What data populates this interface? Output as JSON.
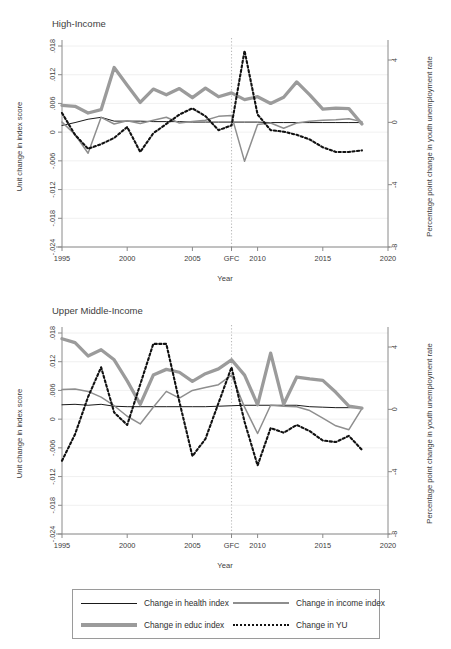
{
  "figure": {
    "background": "#ffffff",
    "xlabel": "Year",
    "ylabel_left": "Unit change in index score",
    "ylabel_right": "Percentage point change in youth unemployment rate"
  },
  "legend": {
    "items": [
      {
        "label": "Change in health index",
        "style": "thin-black-solid",
        "color": "#1a1a1a",
        "icon": "line-swatch-icon"
      },
      {
        "label": "Change in income index",
        "style": "medium-gray-solid",
        "color": "#8e8e8e",
        "icon": "line-swatch-icon"
      },
      {
        "label": "Change in educ index",
        "style": "thick-gray-solid",
        "color": "#9b9b9b",
        "icon": "line-swatch-icon"
      },
      {
        "label": "Change in YU",
        "style": "black-dotted",
        "color": "#111111",
        "icon": "dotted-line-swatch-icon"
      }
    ]
  },
  "chart_data": [
    {
      "type": "line",
      "title": "High-Income",
      "xlabel": "Year",
      "ylabel": "Unit change in index score",
      "ylabel_secondary": "Percentage point change in youth unemployment rate",
      "xlim": [
        1995,
        2020
      ],
      "xticks": [
        1995,
        2000,
        2005,
        2008,
        2010,
        2015,
        2020
      ],
      "xticklabels": [
        "1995",
        "2000",
        "2005",
        "GFC",
        "2010",
        "2015",
        "2020"
      ],
      "ylim": [
        -0.024,
        0.018
      ],
      "yticks": [
        0.018,
        0.012,
        0.006,
        0,
        -0.006,
        -0.012,
        -0.018,
        -0.024
      ],
      "yticklabels": [
        ".018",
        ".012",
        ".006",
        "0",
        "-.006",
        "-.012",
        "-.018",
        "-.024"
      ],
      "ylim_secondary": [
        -8,
        4.9
      ],
      "yticks_secondary": [
        4,
        0,
        -4,
        -8
      ],
      "yticklabels_secondary": [
        "4",
        "0",
        "-4",
        "-8"
      ],
      "grid": true,
      "annotations": [
        {
          "type": "vline",
          "x": 2008,
          "label": "GFC",
          "style": "dotted"
        }
      ],
      "x": [
        1995,
        1996,
        1997,
        1998,
        1999,
        2000,
        2001,
        2002,
        2003,
        2004,
        2005,
        2006,
        2007,
        2008,
        2009,
        2010,
        2011,
        2012,
        2013,
        2014,
        2015,
        2016,
        2017,
        2018
      ],
      "series": [
        {
          "name": "Change in health index",
          "axis": "left",
          "values": [
            0.0014,
            0.002,
            0.0027,
            0.0031,
            0.0023,
            0.0023,
            0.0023,
            0.0022,
            0.0022,
            0.0022,
            0.0021,
            0.0021,
            0.0021,
            0.0021,
            0.0021,
            0.0021,
            0.002,
            0.002,
            0.002,
            0.002,
            0.002,
            0.002,
            0.002,
            0.002
          ]
        },
        {
          "name": "Change in income index",
          "axis": "left",
          "values": [
            0.0021,
            -0.0005,
            -0.0044,
            0.0031,
            0.0017,
            0.0024,
            0.0018,
            0.0025,
            0.0031,
            0.0019,
            0.0022,
            0.0025,
            0.0033,
            0.0035,
            -0.0061,
            0.0016,
            0.0019,
            0.0008,
            0.0019,
            0.0023,
            0.0025,
            0.0026,
            0.0028,
            0.0022
          ]
        },
        {
          "name": "Change in educ index",
          "axis": "left",
          "values": [
            0.0056,
            0.0054,
            0.004,
            0.0047,
            0.0135,
            0.0098,
            0.0062,
            0.009,
            0.0078,
            0.0091,
            0.0072,
            0.0092,
            0.0074,
            0.0082,
            0.0068,
            0.0074,
            0.006,
            0.0073,
            0.0105,
            0.0078,
            0.0048,
            0.005,
            0.0049,
            0.0017
          ]
        },
        {
          "name": "Change in YU",
          "axis": "right",
          "values": [
            0.6,
            -0.8,
            -1.7,
            -1.4,
            -1.0,
            -0.3,
            -1.9,
            -0.7,
            -0.1,
            0.5,
            0.9,
            0.4,
            -0.5,
            -0.2,
            4.6,
            0.5,
            -0.5,
            -0.6,
            -0.8,
            -1.1,
            -1.6,
            -1.9,
            -1.9,
            -1.8
          ]
        }
      ]
    },
    {
      "type": "line",
      "title": "Upper Middle-Income",
      "xlabel": "Year",
      "ylabel": "Unit change in index score",
      "ylabel_secondary": "Percentage point change in youth unemployment rate",
      "xlim": [
        1995,
        2020
      ],
      "xticks": [
        1995,
        2000,
        2005,
        2008,
        2010,
        2015,
        2020
      ],
      "xticklabels": [
        "1995",
        "2000",
        "2005",
        "GFC",
        "2010",
        "2015",
        "2020"
      ],
      "ylim": [
        -0.024,
        0.018
      ],
      "yticks": [
        0.018,
        0.012,
        0.006,
        0,
        -0.006,
        -0.012,
        -0.018,
        -0.024
      ],
      "yticklabels": [
        ".018",
        ".012",
        ".006",
        "0",
        "-.006",
        "-.012",
        "-.018",
        "-.024"
      ],
      "ylim_secondary": [
        -8,
        4.9
      ],
      "yticks_secondary": [
        4,
        0,
        -4,
        -8
      ],
      "yticklabels_secondary": [
        "4",
        "0",
        "-4",
        "-8"
      ],
      "grid": true,
      "annotations": [
        {
          "type": "vline",
          "x": 2008,
          "label": "GFC",
          "style": "dotted"
        }
      ],
      "x": [
        1995,
        1996,
        1997,
        1998,
        1999,
        2000,
        2001,
        2002,
        2003,
        2004,
        2005,
        2006,
        2007,
        2008,
        2009,
        2010,
        2011,
        2012,
        2013,
        2014,
        2015,
        2016,
        2017,
        2018
      ],
      "series": [
        {
          "name": "Change in health index",
          "axis": "left",
          "values": [
            0.003,
            0.0031,
            0.0029,
            0.0031,
            0.0027,
            0.0026,
            0.0026,
            0.0026,
            0.0026,
            0.0026,
            0.0026,
            0.0026,
            0.0027,
            0.0028,
            0.0029,
            0.0029,
            0.0029,
            0.0029,
            0.0029,
            0.0026,
            0.0025,
            0.0024,
            0.0024,
            0.0024
          ]
        },
        {
          "name": "Change in income index",
          "axis": "left",
          "values": [
            0.0062,
            0.0063,
            0.0058,
            0.0046,
            0.0028,
            0.0006,
            -0.001,
            0.0025,
            0.0058,
            0.0044,
            0.006,
            0.0066,
            0.0072,
            0.0092,
            0.0025,
            -0.003,
            0.0029,
            0.0027,
            0.0026,
            0.0018,
            0.0002,
            -0.0014,
            -0.0022,
            0.0022
          ]
        },
        {
          "name": "Change in educ index",
          "axis": "left",
          "values": [
            0.0168,
            0.016,
            0.0132,
            0.0145,
            0.0124,
            0.008,
            0.0031,
            0.0092,
            0.0104,
            0.0098,
            0.0079,
            0.0095,
            0.0105,
            0.0124,
            0.0092,
            0.003,
            0.0138,
            0.0031,
            0.0088,
            0.0084,
            0.0081,
            0.0056,
            0.0027,
            0.0023
          ]
        },
        {
          "name": "Change in YU",
          "axis": "right",
          "values": [
            -3.3,
            -1.6,
            0.8,
            2.7,
            -0.2,
            -1.0,
            1.6,
            4.2,
            4.2,
            0.5,
            -3.0,
            -1.9,
            0.4,
            2.7,
            -0.8,
            -3.6,
            -1.2,
            -1.5,
            -1.0,
            -1.4,
            -2.0,
            -2.1,
            -1.7,
            -2.6
          ]
        }
      ]
    }
  ]
}
